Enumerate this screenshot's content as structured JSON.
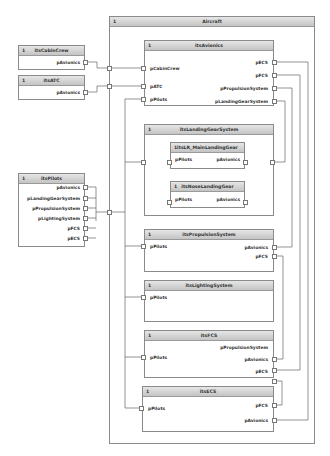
{
  "diagram": {
    "outer": {
      "multiplicity": "1",
      "name": "Aircraft"
    },
    "external_parts": [
      {
        "id": "cabin",
        "multiplicity": "1",
        "name": "itsCabinCrew",
        "ports": [
          "pAvionics"
        ]
      },
      {
        "id": "atc",
        "multiplicity": "1",
        "name": "itsATC",
        "ports": [
          "pAvionics"
        ]
      },
      {
        "id": "pilots",
        "multiplicity": "1",
        "name": "itsPilots",
        "ports": [
          "pAvionics",
          "pLandingGearSystem",
          "pPropulsionSystem",
          "pLightingSystem",
          "pFCS",
          "pECS"
        ]
      }
    ],
    "parts": {
      "avionics": {
        "multiplicity": "1",
        "name": "itsAvionics",
        "left_ports": [
          "pCabinCrew",
          "pATC",
          "pPilots"
        ],
        "right_ports": [
          "pECS",
          "pFCS",
          "pPropulsionSystem",
          "pLandingGearSystem"
        ]
      },
      "landing": {
        "multiplicity": "1",
        "name": "itsLandingGearSystem",
        "sub": [
          {
            "multiplicity": "1",
            "name": "itsLR_MainLandingGear",
            "left_port": "pPilots",
            "right_port": "pAvionics"
          },
          {
            "multiplicity": "1",
            "name": "itsNoseLandingGear",
            "left_port": "pPilots",
            "right_port": "pAvionics"
          }
        ]
      },
      "propulsion": {
        "multiplicity": "1",
        "name": "itsPropulsionSystem",
        "left_port": "pPilots",
        "right_ports": [
          "pAvionics",
          "pFCS"
        ]
      },
      "lighting": {
        "multiplicity": "1",
        "name": "itsLightingSystem",
        "left_port": "pPilots"
      },
      "fcs": {
        "multiplicity": "1",
        "name": "itsFCS",
        "left_port": "pPilots",
        "right_ports": [
          "pPropulsionSystem",
          "pAvionics",
          "pECS"
        ]
      },
      "ecs": {
        "multiplicity": "1",
        "name": "itsECS",
        "left_port": "pPilots",
        "right_ports": [
          "pFCS",
          "pAvionics"
        ]
      }
    },
    "colors": {
      "border": "#8a8a8a",
      "header_top": "#e6e6e6",
      "header_bottom": "#c4c4c4",
      "wire": "#666666"
    }
  }
}
